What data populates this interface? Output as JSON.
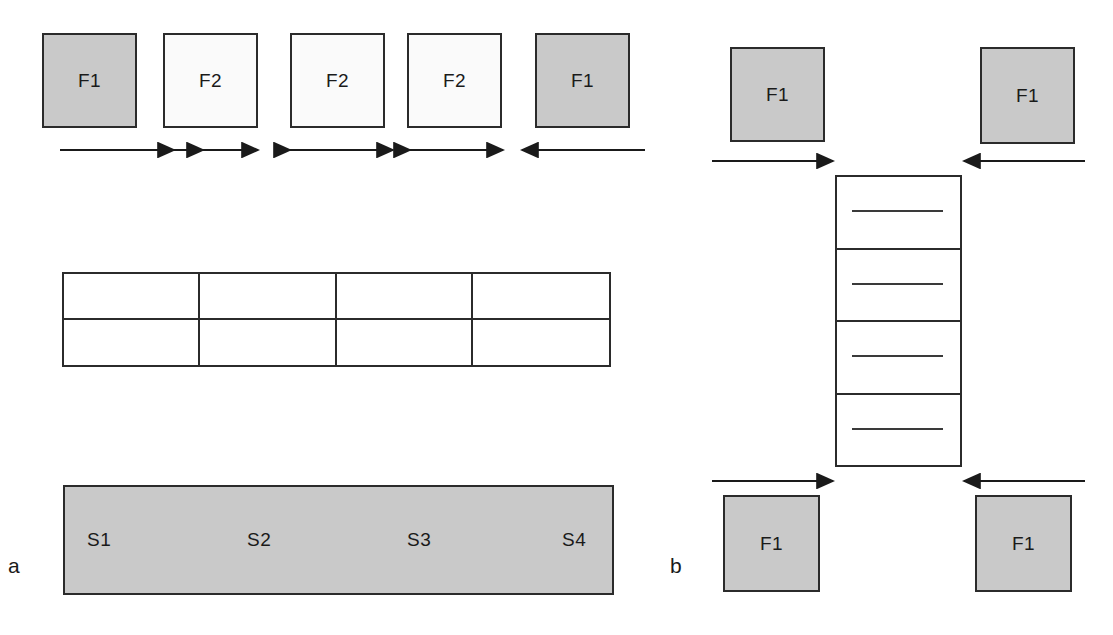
{
  "figure": {
    "background": "#ffffff",
    "shaded_fill": "#c9c9c9",
    "plain_fill": "#fafafa",
    "stroke": "#2b2b2b"
  },
  "panels": [
    {
      "id": "a",
      "label": "a"
    },
    {
      "id": "b",
      "label": "b"
    }
  ],
  "panel_a": {
    "label": "a",
    "top_row": {
      "boxes": [
        {
          "label": "F1",
          "shade": "shaded",
          "x": 42,
          "y": 33,
          "w": 95,
          "h": 95
        },
        {
          "label": "F2",
          "shade": "plain",
          "x": 163,
          "y": 33,
          "w": 95,
          "h": 95
        },
        {
          "label": "F2",
          "shade": "plain",
          "x": 290,
          "y": 33,
          "w": 95,
          "h": 95
        },
        {
          "label": "F2",
          "shade": "plain",
          "x": 407,
          "y": 33,
          "w": 95,
          "h": 95
        },
        {
          "label": "F1",
          "shade": "shaded",
          "x": 535,
          "y": 33,
          "w": 95,
          "h": 95
        }
      ],
      "arrows": [
        {
          "direction": "right",
          "x1": 60,
          "x2": 205,
          "y": 150
        },
        {
          "direction": "both",
          "x1": 172,
          "x2": 260,
          "y": 150
        },
        {
          "direction": "both",
          "x1": 288,
          "x2": 395,
          "y": 150
        },
        {
          "direction": "both",
          "x1": 408,
          "x2": 505,
          "y": 150
        },
        {
          "direction": "left",
          "x1": 520,
          "x2": 645,
          "y": 150
        }
      ]
    },
    "table": {
      "x": 62,
      "y": 272,
      "w": 549,
      "h": 95,
      "rows": 2,
      "columns": 4,
      "headers": [
        "",
        "",
        "",
        ""
      ],
      "cells": [
        [
          "",
          "",
          "",
          ""
        ],
        [
          "",
          "",
          "",
          ""
        ]
      ]
    },
    "strip": {
      "x": 63,
      "y": 485,
      "w": 551,
      "h": 110,
      "segments": [
        {
          "label": "S1",
          "x": 22
        },
        {
          "label": "S2",
          "x": 182
        },
        {
          "label": "S3",
          "x": 342
        },
        {
          "label": "S4",
          "x": 497
        }
      ]
    }
  },
  "panel_b": {
    "label": "b",
    "boxes": [
      {
        "label": "F1",
        "shade": "shaded",
        "position": "top-left",
        "x": 730,
        "y": 47,
        "w": 95,
        "h": 95
      },
      {
        "label": "F1",
        "shade": "shaded",
        "position": "top-right",
        "x": 980,
        "y": 47,
        "w": 95,
        "h": 97
      },
      {
        "label": "F1",
        "shade": "shaded",
        "position": "bottom-left",
        "x": 723,
        "y": 495,
        "w": 97,
        "h": 97
      },
      {
        "label": "F1",
        "shade": "shaded",
        "position": "bottom-right",
        "x": 975,
        "y": 495,
        "w": 97,
        "h": 97
      }
    ],
    "arrows": [
      {
        "direction": "right",
        "x1": 712,
        "x2": 835,
        "y": 161
      },
      {
        "direction": "left",
        "x1": 962,
        "x2": 1085,
        "y": 161
      },
      {
        "direction": "right",
        "x1": 712,
        "x2": 835,
        "y": 481
      },
      {
        "direction": "left",
        "x1": 962,
        "x2": 1085,
        "y": 481
      }
    ],
    "ladder": {
      "x": 835,
      "y": 175,
      "w": 127,
      "h": 292,
      "rungs": 4,
      "rung_line_count": 4
    }
  }
}
